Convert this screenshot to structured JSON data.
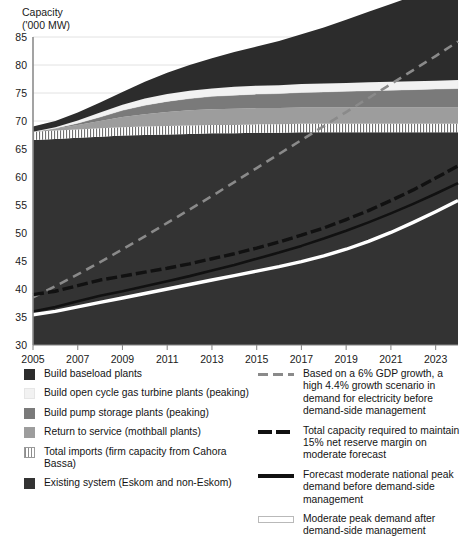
{
  "axis_title": "Capacity\n('000 MW)",
  "chart_data": {
    "type": "area",
    "title": "Capacity ('000 MW)",
    "xlabel": "",
    "ylabel": "Capacity ('000 MW)",
    "ylim": [
      30,
      85
    ],
    "xlim": [
      2005,
      2024
    ],
    "ytick_labels": [
      "85",
      "80",
      "75",
      "70",
      "65",
      "60",
      "55",
      "50",
      "45",
      "40",
      "35",
      "30"
    ],
    "ytick_values": [
      85,
      80,
      75,
      70,
      65,
      60,
      55,
      50,
      45,
      40,
      35,
      30
    ],
    "xtick_labels": [
      "2005",
      "2007",
      "2009",
      "2011",
      "2013",
      "2015",
      "2017",
      "2019",
      "2021",
      "2023"
    ],
    "xtick_values": [
      2005,
      2007,
      2009,
      2011,
      2013,
      2015,
      2017,
      2019,
      2021,
      2023
    ],
    "grid": true,
    "legend_position": "below",
    "x": [
      2005,
      2006,
      2007,
      2008,
      2009,
      2010,
      2011,
      2012,
      2013,
      2014,
      2015,
      2016,
      2017,
      2018,
      2019,
      2020,
      2021,
      2022,
      2023,
      2024
    ],
    "series": [
      {
        "name": "Existing system (Eskom and non-Eskom)",
        "type": "stacked-area",
        "color": "#333333",
        "values": [
          36.6,
          36.8,
          37.0,
          37.2,
          37.4,
          37.5,
          37.6,
          37.7,
          37.8,
          37.8,
          37.9,
          37.9,
          38.0,
          38.0,
          38.0,
          38.0,
          38.0,
          38.0,
          38.0,
          38.0
        ]
      },
      {
        "name": "Total imports (firm capacity from Cahora Bassa)",
        "type": "stacked-area",
        "color": "#ffffff",
        "pattern": "vertical-hatch",
        "values": [
          1.5,
          1.5,
          1.5,
          1.5,
          1.5,
          1.5,
          1.5,
          1.5,
          1.5,
          1.5,
          1.5,
          1.5,
          1.5,
          1.5,
          1.5,
          1.5,
          1.5,
          1.5,
          1.5,
          1.5
        ]
      },
      {
        "name": "Return to service (mothball plants)",
        "type": "stacked-area",
        "color": "#9d9d9d",
        "values": [
          0.0,
          0.3,
          0.8,
          1.3,
          1.8,
          2.2,
          2.5,
          2.7,
          2.8,
          2.9,
          2.9,
          2.9,
          2.9,
          2.9,
          2.9,
          2.9,
          2.9,
          2.9,
          2.9,
          2.9
        ]
      },
      {
        "name": "Build pump storage plants (peaking)",
        "type": "stacked-area",
        "color": "#7a7a7a",
        "values": [
          0.0,
          0.1,
          0.3,
          0.7,
          1.2,
          1.6,
          1.9,
          2.1,
          2.3,
          2.4,
          2.5,
          2.6,
          2.7,
          2.8,
          2.9,
          3.0,
          3.1,
          3.2,
          3.3,
          3.4
        ]
      },
      {
        "name": "Build open cycle gas turbine plants (peaking)",
        "type": "stacked-area",
        "color": "#f2f2f2",
        "values": [
          0.0,
          0.2,
          0.5,
          0.8,
          1.0,
          1.2,
          1.3,
          1.4,
          1.4,
          1.5,
          1.5,
          1.5,
          1.5,
          1.5,
          1.5,
          1.5,
          1.5,
          1.5,
          1.5,
          1.5
        ]
      },
      {
        "name": "Build baseload plants",
        "type": "stacked-area",
        "color": "#2c2c2c",
        "values": [
          0.9,
          1.1,
          1.4,
          1.8,
          2.3,
          3.0,
          3.8,
          4.6,
          5.4,
          6.2,
          7.0,
          7.9,
          8.9,
          10.0,
          11.3,
          12.6,
          13.9,
          15.2,
          16.4,
          17.7
        ]
      },
      {
        "name": "Based on a 6% GDP growth, a high 4.4% growth scenario in demand for electricity before demand-side management",
        "type": "line",
        "style": "dashed",
        "color": "#8a8a8a",
        "values": [
          38.5,
          40.5,
          42.6,
          44.8,
          47.1,
          49.4,
          51.8,
          54.2,
          56.6,
          59.1,
          61.6,
          64.1,
          66.6,
          69.1,
          71.6,
          74.1,
          76.6,
          79.1,
          81.6,
          84.2
        ]
      },
      {
        "name": "Total capacity required to maintain 15% net reserve margin on moderate forecast",
        "type": "line",
        "style": "dashed-heavy",
        "color": "#111111",
        "values": [
          39.0,
          39.6,
          40.6,
          41.6,
          42.3,
          43.0,
          43.7,
          44.5,
          45.4,
          46.3,
          47.3,
          48.4,
          49.6,
          50.9,
          52.4,
          54.0,
          55.8,
          57.7,
          59.8,
          62.0
        ]
      },
      {
        "name": "Forecast moderate national peak demand before demand-side management",
        "type": "line",
        "style": "solid",
        "color": "#111111",
        "values": [
          36.0,
          36.8,
          37.8,
          38.8,
          39.6,
          40.5,
          41.4,
          42.3,
          43.3,
          44.3,
          45.4,
          46.5,
          47.7,
          49.0,
          50.4,
          51.9,
          53.5,
          55.2,
          57.0,
          58.9
        ]
      },
      {
        "name": "Moderate peak demand after demand-side management",
        "type": "line",
        "style": "solid-white",
        "color": "#ffffff",
        "values": [
          35.4,
          36.0,
          36.8,
          37.6,
          38.4,
          39.2,
          40.0,
          40.8,
          41.6,
          42.4,
          43.2,
          44.0,
          44.9,
          45.9,
          47.1,
          48.5,
          50.1,
          51.9,
          53.8,
          55.8
        ]
      }
    ]
  },
  "legend": {
    "left_items": [
      {
        "swatch": "sw-baseload",
        "icon": "square-swatch-dark",
        "label": "Build baseload plants"
      },
      {
        "swatch": "sw-gas",
        "icon": "square-swatch-light",
        "label": "Build open cycle gas turbine plants (peaking)"
      },
      {
        "swatch": "sw-pump",
        "icon": "square-swatch-medium-gray",
        "label": "Build pump storage plants (peaking)"
      },
      {
        "swatch": "sw-mothball",
        "icon": "square-swatch-gray",
        "label": "Return to service (mothball plants)"
      },
      {
        "swatch": "sw-imports",
        "icon": "square-swatch-hatched",
        "label": "Total imports (firm capacity from Cahora Bassa)"
      },
      {
        "swatch": "sw-existing",
        "icon": "square-swatch-dark",
        "label": "Existing system (Eskom and non-Eskom)"
      }
    ],
    "right_items": [
      {
        "swatch": "ls-gdp",
        "icon": "dashed-gray-line-icon",
        "label": "Based on a 6% GDP growth, a high 4.4% growth scenario in demand for electricity before demand-side management"
      },
      {
        "swatch": "ls-reserve",
        "icon": "dashed-black-line-icon",
        "label": "Total capacity required to maintain 15% net reserve margin on moderate forecast"
      },
      {
        "swatch": "ls-forecast",
        "icon": "solid-black-line-icon",
        "label": "Forecast moderate national peak demand before demand-side management"
      },
      {
        "swatch": "ls-moderate",
        "icon": "solid-white-line-icon",
        "label": "Moderate peak demand after demand-side management"
      }
    ]
  },
  "colors": {
    "baseload": "#2c2c2c",
    "gas_turbine": "#f2f2f2",
    "pump_storage": "#7a7a7a",
    "mothball": "#9d9d9d",
    "imports": "#ffffff",
    "existing": "#333333",
    "gdp_line": "#8a8a8a",
    "reserve_line": "#111111",
    "forecast_line": "#111111",
    "moderate_line": "#ffffff",
    "gridline": "#e2e2e2",
    "axis": "#8c8c8c"
  }
}
